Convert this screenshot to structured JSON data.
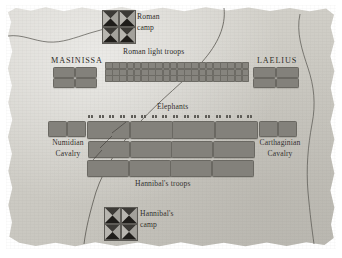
{
  "map": {
    "title": "Battle of Zama troop deployment map",
    "style": "parchment",
    "colors": {
      "parchment": "#d2d0ca",
      "unit_fill": "#83817b",
      "unit_stroke": "#6a6862",
      "ink": "#2a2824",
      "river": "#5a5852"
    }
  },
  "labels": {
    "roman_camp": {
      "line1": "Roman",
      "line2": "camp"
    },
    "hannibal_camp": {
      "line1": "Hannibal's",
      "line2": "camp"
    },
    "masinissa": "MASINISSA",
    "laelius": "LAELIUS",
    "roman_light_troops": "Roman light troops",
    "elephants": "Elephants",
    "numidian_cavalry": {
      "line1": "Numidian",
      "line2": "Cavalry"
    },
    "carthaginian_cavalry": {
      "line1": "Carthaginian",
      "line2": "Cavalry"
    },
    "hannibals_troops": "Hannibal's troops"
  },
  "formations": {
    "roman_light_troops": {
      "rows": 3,
      "cols": 20,
      "unit_w": 5.6,
      "unit_h": 5.2,
      "gap_x": 1.6,
      "gap_y": 1.4
    },
    "masinissa_cavalry": {
      "rows": 2,
      "cols": 2,
      "block_w": 20,
      "block_h": 8.5
    },
    "laelius_cavalry": {
      "rows": 2,
      "cols": 2,
      "block_w": 21,
      "block_h": 8.5
    },
    "elephants": {
      "count": 16
    },
    "hannibal_lines": {
      "rows": 3,
      "cols": 4
    },
    "numidian_cavalry": {
      "count": 2
    },
    "carthaginian_cavalry": {
      "count": 2
    },
    "roman_camp_tents": 4,
    "hannibal_camp_tents": 4
  },
  "icons": {
    "camp_tent": "pyramid-tent-icon",
    "elephant": "elephant-pair-icon",
    "river": "river-line"
  }
}
